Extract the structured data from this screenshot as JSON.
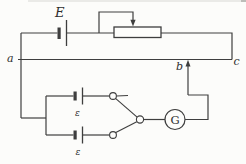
{
  "figure": {
    "type": "circuit-diagram",
    "colors": {
      "line": "#3e3e3e",
      "background": "#fcfcfa",
      "top_artifact": "#d8d8d4"
    },
    "labels": {
      "battery": "E",
      "point_a": "a",
      "point_b": "b",
      "point_c": "c",
      "emf_top": "ε",
      "emf_bottom": "ε",
      "galvanometer": "G"
    },
    "components": [
      "battery-E",
      "rheostat-with-sliding-tap",
      "potentiometer-wire-a-c",
      "jockey-contact-arrow-b",
      "cell-emf-top",
      "cell-emf-bottom",
      "two-way-selector-switch",
      "galvanometer-G"
    ]
  }
}
